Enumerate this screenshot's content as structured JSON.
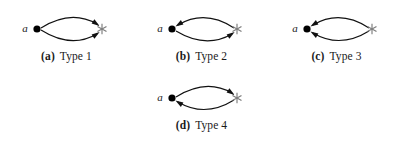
{
  "figure": {
    "background_color": "#ffffff",
    "panels": [
      {
        "id": "panel-a",
        "tag": "(a)",
        "label": "Type 1",
        "node_left_label": "a",
        "node_left_marker": "filled-dot",
        "node_right_marker": "star",
        "edges": [
          {
            "position": "upper",
            "direction": "to-star"
          },
          {
            "position": "lower",
            "direction": "to-star"
          }
        ]
      },
      {
        "id": "panel-b",
        "tag": "(b)",
        "label": "Type 2",
        "node_left_label": "a",
        "node_left_marker": "filled-dot",
        "node_right_marker": "star",
        "edges": [
          {
            "position": "upper",
            "direction": "to-dot"
          },
          {
            "position": "lower",
            "direction": "to-star"
          }
        ]
      },
      {
        "id": "panel-c",
        "tag": "(c)",
        "label": "Type 3",
        "node_left_label": "a",
        "node_left_marker": "filled-dot",
        "node_right_marker": "star",
        "edges": [
          {
            "position": "upper",
            "direction": "to-dot"
          },
          {
            "position": "lower",
            "direction": "to-dot"
          }
        ]
      },
      {
        "id": "panel-d",
        "tag": "(d)",
        "label": "Type 4",
        "node_left_label": "a",
        "node_left_marker": "filled-dot",
        "node_right_marker": "star",
        "edges": [
          {
            "position": "upper",
            "direction": "to-star"
          },
          {
            "position": "lower",
            "direction": "to-dot"
          }
        ]
      }
    ],
    "colors": {
      "edge": "#111111",
      "dot": "#000000",
      "star": "#7d7d7d",
      "text": "#1a1a1a"
    }
  }
}
